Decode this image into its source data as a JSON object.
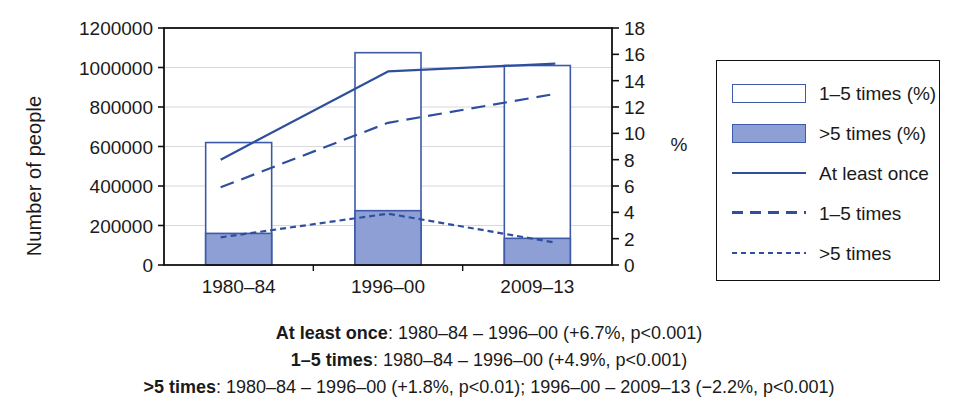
{
  "chart_data": {
    "type": "bar",
    "title": "",
    "subtitle": "",
    "categories": [
      "1980–84",
      "1996–00",
      "2009–13"
    ],
    "xlabel": "",
    "ylabel": "Number of people",
    "ylabel_right": "%",
    "ylim": [
      0,
      1200000
    ],
    "yticks": [
      "0",
      "200000",
      "400000",
      "600000",
      "800000",
      "1000000",
      "1200000"
    ],
    "ytick_values": [
      0,
      200000,
      400000,
      600000,
      800000,
      1000000,
      1200000
    ],
    "ylim_right": [
      0,
      18
    ],
    "yticks_right": [
      "0",
      "2",
      "4",
      "6",
      "8",
      "10",
      "12",
      "14",
      "16",
      "18"
    ],
    "ytick_values_right": [
      0,
      2,
      4,
      6,
      8,
      10,
      12,
      14,
      16,
      18
    ],
    "grid": true,
    "legend_position": "right-outside",
    "series": [
      {
        "name": "1–5 times (%)",
        "render": "bar-stacked-top",
        "axis": "left",
        "fill": "#ffffff",
        "stroke": "#3d5aa8",
        "values": [
          460000,
          800000,
          875000
        ]
      },
      {
        "name": ">5 times (%)",
        "render": "bar-stacked-bottom",
        "axis": "left",
        "fill": "#8d9fd4",
        "stroke": "#3d5aa8",
        "values": [
          160000,
          275000,
          135000
        ]
      },
      {
        "name": "At least once",
        "render": "line",
        "dash": "solid",
        "axis": "right",
        "stroke": "#2e4f9e",
        "values": [
          8.0,
          14.7,
          15.3
        ]
      },
      {
        "name": "1–5 times",
        "render": "line",
        "dash": "dashed",
        "axis": "right",
        "stroke": "#2e4f9e",
        "values": [
          5.9,
          10.8,
          13.0
        ]
      },
      {
        "name": ">5 times",
        "render": "line",
        "dash": "dotted",
        "axis": "right",
        "stroke": "#2e4f9e",
        "values": [
          2.1,
          3.9,
          1.7
        ]
      }
    ],
    "bar_totals": [
      620000,
      1075000,
      1010000
    ],
    "annotations": [
      "At least once: 1980–84 – 1996–00 (+6.7%, p<0.001)",
      "1–5 times: 1980–84 – 1996–00 (+4.9%, p<0.001)",
      ">5 times: 1980–84 – 1996–00 (+1.8%, p<0.01); 1996–00 – 2009–13 (−2.2%, p<0.001)"
    ]
  },
  "legend": {
    "items": [
      {
        "label": "1–5 times (%)",
        "kind": "swatch-open"
      },
      {
        "label": ">5 times (%)",
        "kind": "swatch-filled"
      },
      {
        "label": "At least once",
        "kind": "line-solid"
      },
      {
        "label": "1–5 times",
        "kind": "line-dashed"
      },
      {
        "label": ">5 times",
        "kind": "line-dotted"
      }
    ]
  },
  "caption": {
    "line1_bold": "At least once",
    "line1_rest": ": 1980–84 – 1996–00 (+6.7%, p<0.001)",
    "line2_bold": "1–5 times",
    "line2_rest": ": 1980–84 – 1996–00 (+4.9%, p<0.001)",
    "line3_bold": ">5 times",
    "line3_rest": ": 1980–84 – 1996–00 (+1.8%, p<0.01); 1996–00 – 2009–13 (−2.2%, p<0.001)"
  },
  "colors": {
    "bar_stroke": "#3d5aa8",
    "bar_fill": "#8d9fd4",
    "line": "#2e4f9e",
    "axis": "#111111",
    "grid": "#d8d8dd"
  }
}
